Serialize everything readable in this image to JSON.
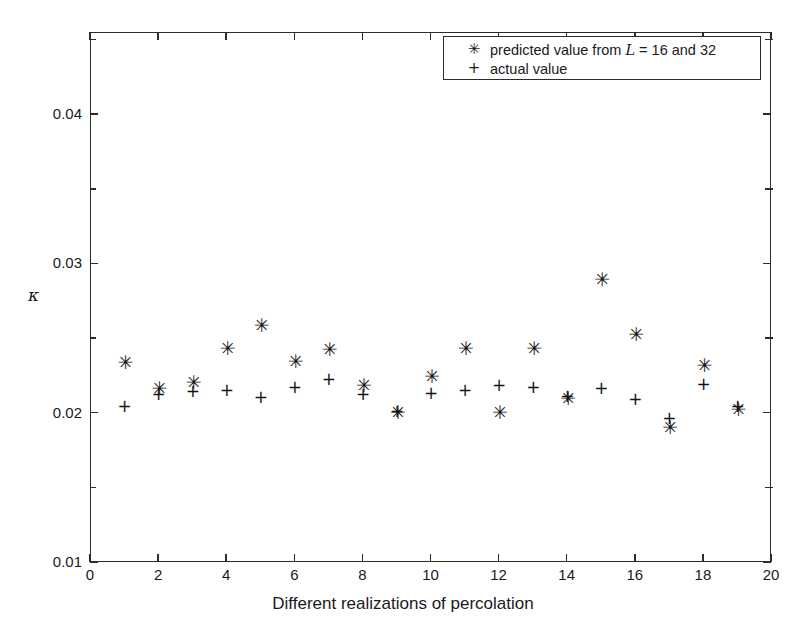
{
  "chart_data": {
    "type": "scatter",
    "title": "",
    "xlabel": "Different realizations of percolation",
    "ylabel": "κ",
    "xlim": [
      0,
      20
    ],
    "ylim": [
      0.01,
      0.0455
    ],
    "grid": false,
    "legend_position": "top-right",
    "xticks": [
      0,
      2,
      4,
      6,
      8,
      10,
      12,
      14,
      16,
      18,
      20
    ],
    "xtick_labels": [
      "0",
      "2",
      "4",
      "6",
      "8",
      "10",
      "12",
      "14",
      "16",
      "18",
      "20"
    ],
    "yticks": [
      0.01,
      0.02,
      0.03,
      0.04
    ],
    "ytick_labels": [
      "0.01",
      "0.02",
      "0.03",
      "0.04"
    ],
    "yminor_ticks": [
      0.015,
      0.025,
      0.035,
      0.045
    ],
    "x": [
      1,
      2,
      3,
      4,
      5,
      6,
      7,
      8,
      9,
      10,
      11,
      12,
      13,
      14,
      15,
      16,
      17,
      18,
      19
    ],
    "series": [
      {
        "name": "predicted value from L = 16 and 32",
        "marker": "*",
        "marker_glyph": "✳",
        "values": [
          0.0234,
          0.0217,
          0.0221,
          0.0244,
          0.0259,
          0.0235,
          0.0243,
          0.0219,
          0.0201,
          0.0225,
          0.0244,
          0.0201,
          0.0244,
          0.021,
          0.029,
          0.0253,
          0.0191,
          0.0232,
          0.0203
        ]
      },
      {
        "name": "actual value",
        "marker": "+",
        "marker_glyph": "+",
        "values": [
          0.0204,
          0.0212,
          0.0214,
          0.0215,
          0.021,
          0.0217,
          0.0222,
          0.0212,
          0.0201,
          0.0213,
          0.0215,
          0.0218,
          0.0217,
          0.0211,
          0.0216,
          0.0209,
          0.0196,
          0.0219,
          0.0204
        ]
      }
    ]
  },
  "legend": {
    "entries": [
      {
        "symbol": "✳",
        "label_pre": "predicted value from ",
        "label_var": "L",
        "label_post": " = 16 and 32",
        "icon_name": "asterisk-marker-icon"
      },
      {
        "symbol": "+",
        "label_pre": "actual value",
        "label_var": "",
        "label_post": "",
        "icon_name": "plus-marker-icon"
      }
    ]
  },
  "axes": {
    "y_title": "κ",
    "x_title": "Different realizations of percolation"
  },
  "colors": {
    "axis": "#2b2b2b",
    "marker": "#141414",
    "background": "#ffffff"
  }
}
